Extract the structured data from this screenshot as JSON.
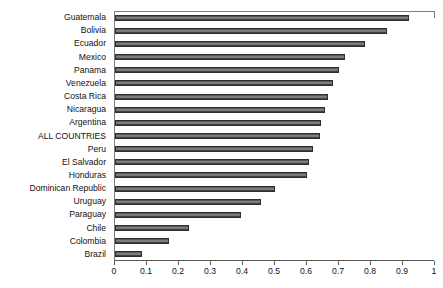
{
  "chart_data": {
    "type": "bar",
    "orientation": "horizontal",
    "title": "",
    "subtitle": "",
    "xlabel": "",
    "ylabel": "",
    "xlim": [
      0,
      1
    ],
    "xticks": [
      "0",
      "0.1",
      "0.2",
      "0.3",
      "0.4",
      "0.5",
      "0.6",
      "0.7",
      "0.8",
      "0.9",
      "1"
    ],
    "xtick_values": [
      0,
      0.1,
      0.2,
      0.3,
      0.4,
      0.5,
      0.6,
      0.7,
      0.8,
      0.9,
      1
    ],
    "grid": false,
    "legend": null,
    "bar_color": "#4a4a4a",
    "categories": [
      "Guatemala",
      "Bolivia",
      "Ecuador",
      "Mexico",
      "Panama",
      "Venezuela",
      "Costa Rica",
      "Nicaragua",
      "Argentina",
      "ALL COUNTRIES",
      "Peru",
      "El Salvador",
      "Honduras",
      "Dominican Republic",
      "Uruguay",
      "Paraguay",
      "Chile",
      "Colombia",
      "Brazil"
    ],
    "values": [
      0.92,
      0.85,
      0.78,
      0.72,
      0.7,
      0.68,
      0.665,
      0.655,
      0.645,
      0.64,
      0.62,
      0.605,
      0.6,
      0.5,
      0.455,
      0.395,
      0.23,
      0.17,
      0.085
    ]
  }
}
